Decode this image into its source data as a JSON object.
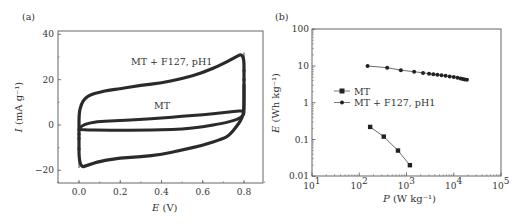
{
  "chart_data": [
    {
      "panel": "(a)",
      "type": "line",
      "xlabel": "E (V)",
      "ylabel": "I (mA g⁻¹)",
      "xlim": [
        -0.1,
        0.9
      ],
      "ylim": [
        -25,
        42
      ],
      "xticks": [
        "0.0",
        "0.2",
        "0.4",
        "0.6",
        "0.8"
      ],
      "yticks": [
        "−20",
        "0",
        "20",
        "40"
      ],
      "grid": false,
      "annotations": [
        "MT + F127, pH1",
        "MT"
      ],
      "series": [
        {
          "name": "MT + F127, pH1",
          "x": [
            0.0,
            0.0,
            0.01,
            0.03,
            0.06,
            0.1,
            0.15,
            0.2,
            0.3,
            0.4,
            0.5,
            0.6,
            0.7,
            0.75,
            0.8,
            0.8,
            0.8,
            0.79,
            0.77,
            0.73,
            0.7,
            0.6,
            0.5,
            0.4,
            0.3,
            0.2,
            0.1,
            0.05,
            0.0,
            0.0
          ],
          "y": [
            -3,
            5,
            9,
            12,
            13.5,
            14.5,
            15.5,
            16,
            17.5,
            18.5,
            20.5,
            23,
            27,
            29.5,
            32,
            20,
            6,
            3,
            0,
            -4.5,
            -6,
            -9,
            -11,
            -13,
            -14,
            -14.5,
            -16,
            -17.5,
            -19,
            -3
          ]
        },
        {
          "name": "MT",
          "x": [
            0.0,
            0.01,
            0.05,
            0.1,
            0.2,
            0.3,
            0.4,
            0.5,
            0.6,
            0.7,
            0.8,
            0.8,
            0.78,
            0.75,
            0.7,
            0.6,
            0.5,
            0.4,
            0.3,
            0.2,
            0.1,
            0.05,
            0.0
          ],
          "y": [
            -2,
            -0.5,
            1,
            1.5,
            2,
            2.5,
            3,
            3.8,
            4.5,
            5.5,
            6.5,
            4.5,
            3,
            2,
            0.8,
            -0.8,
            -1.8,
            -2.2,
            -2.3,
            -2.3,
            -2.3,
            -2.2,
            -2
          ]
        }
      ]
    },
    {
      "panel": "(b)",
      "type": "line",
      "xscale": "log",
      "yscale": "log",
      "xlabel": "P (W kg⁻¹)",
      "ylabel": "E (Wh kg⁻¹)",
      "xlim": [
        10,
        100000
      ],
      "ylim": [
        0.01,
        100
      ],
      "xticks": [
        "10¹",
        "10²",
        "10³",
        "10⁴",
        "10⁵"
      ],
      "yticks": [
        "0.01",
        "0.1",
        "1",
        "10",
        "100"
      ],
      "grid": false,
      "legend": {
        "position": "center-left",
        "entries": [
          "MT",
          "MT + F127, pH1"
        ]
      },
      "series": [
        {
          "name": "MT",
          "marker": "square",
          "x": [
            170,
            330,
            660,
            1180
          ],
          "y": [
            0.22,
            0.12,
            0.05,
            0.02
          ]
        },
        {
          "name": "MT + F127, pH1",
          "marker": "circle",
          "x": [
            150,
            390,
            760,
            1450,
            2240,
            3000,
            3700,
            4500,
            5500,
            6700,
            8200,
            10000,
            12000,
            14000,
            15500,
            17000,
            19000
          ],
          "y": [
            10,
            9,
            7.7,
            7,
            6.5,
            6.2,
            6,
            5.8,
            5.6,
            5.4,
            5.2,
            5,
            4.8,
            4.6,
            4.4,
            4.3,
            4.2
          ]
        }
      ]
    }
  ],
  "panel_a": {
    "label": "(a)",
    "xlabel_italic": "E",
    "xlabel_rest": " (V)",
    "ylabel_italic": "I",
    "ylabel_rest": " (mA g⁻¹)",
    "annotation_f127": "MT + F127, pH1",
    "annotation_mt": "MT",
    "xticks": [
      "0.0",
      "0.2",
      "0.4",
      "0.6",
      "0.8"
    ],
    "yticks": [
      "−20",
      "0",
      "20",
      "40"
    ]
  },
  "panel_b": {
    "label": "(b)",
    "xlabel_italic": "P",
    "xlabel_rest": " (W kg⁻¹)",
    "ylabel_italic": "E",
    "ylabel_rest": " (Wh kg⁻¹)",
    "legend_mt": "MT",
    "legend_f127": "MT + F127, pH1",
    "xtick_base": "10",
    "xtick_exps": [
      "1",
      "2",
      "3",
      "4",
      "5"
    ],
    "yticks": [
      "100",
      "10",
      "1",
      "0.1",
      "0.01"
    ]
  },
  "colors": {
    "line": "#2a2a2a",
    "axis": "#444444",
    "text": "#333333"
  }
}
